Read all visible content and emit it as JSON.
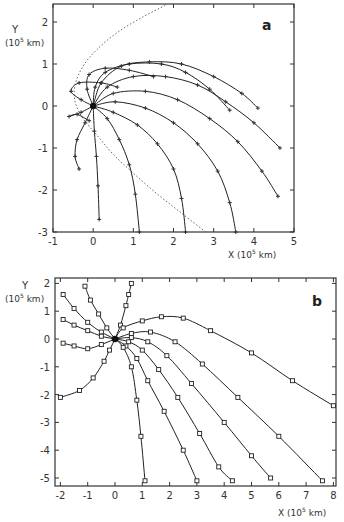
{
  "chart_data": [
    {
      "type": "line",
      "panel_label": "a",
      "xlabel": "X (10^5 km)",
      "ylabel": "Y (10^5 km)",
      "xlim": [
        -1,
        5
      ],
      "ylim": [
        -3,
        2.4
      ],
      "xticks": [
        -1,
        0,
        1,
        2,
        3,
        4,
        5
      ],
      "yticks": [
        -3,
        -2,
        -1,
        0,
        1,
        2
      ],
      "grid": false,
      "legend": null,
      "origin_marker": [
        0,
        0
      ],
      "boundary_dotted": [
        [
          2.8,
          -3
        ],
        [
          2.2,
          -2.55
        ],
        [
          1.6,
          -2.1
        ],
        [
          1.0,
          -1.6
        ],
        [
          0.5,
          -1.15
        ],
        [
          0.1,
          -0.7
        ],
        [
          -0.25,
          -0.3
        ],
        [
          -0.45,
          0.1
        ],
        [
          -0.45,
          0.5
        ],
        [
          -0.25,
          0.95
        ],
        [
          0.1,
          1.35
        ],
        [
          0.6,
          1.75
        ],
        [
          1.2,
          2.1
        ],
        [
          1.8,
          2.4
        ]
      ],
      "series": [
        {
          "name": "traj1",
          "points": [
            [
              0,
              0
            ],
            [
              -0.3,
              0.15
            ],
            [
              -0.55,
              0.35
            ],
            [
              -0.35,
              0.55
            ],
            [
              0.2,
              0.55
            ],
            [
              0.6,
              0.45
            ]
          ]
        },
        {
          "name": "traj2",
          "points": [
            [
              0,
              0
            ],
            [
              -0.15,
              0.4
            ],
            [
              -0.1,
              0.75
            ],
            [
              0.3,
              0.9
            ],
            [
              0.9,
              0.85
            ],
            [
              1.5,
              0.7
            ]
          ]
        },
        {
          "name": "traj3",
          "points": [
            [
              0,
              0
            ],
            [
              0.05,
              0.45
            ],
            [
              0.3,
              0.8
            ],
            [
              0.9,
              1.0
            ],
            [
              1.7,
              1.0
            ],
            [
              2.3,
              0.8
            ],
            [
              2.9,
              0.4
            ],
            [
              3.4,
              -0.1
            ]
          ]
        },
        {
          "name": "traj4",
          "points": [
            [
              0,
              0
            ],
            [
              0.2,
              0.55
            ],
            [
              0.7,
              0.95
            ],
            [
              1.4,
              1.05
            ],
            [
              2.2,
              1.0
            ],
            [
              3.0,
              0.7
            ],
            [
              3.7,
              0.3
            ],
            [
              4.1,
              -0.05
            ]
          ]
        },
        {
          "name": "traj5",
          "points": [
            [
              0,
              0
            ],
            [
              0.35,
              0.45
            ],
            [
              1.0,
              0.7
            ],
            [
              1.8,
              0.7
            ],
            [
              2.6,
              0.5
            ],
            [
              3.3,
              0.1
            ],
            [
              4.0,
              -0.4
            ],
            [
              4.65,
              -1.0
            ]
          ]
        },
        {
          "name": "traj6",
          "points": [
            [
              0,
              0
            ],
            [
              0.5,
              0.3
            ],
            [
              1.3,
              0.35
            ],
            [
              2.1,
              0.15
            ],
            [
              2.9,
              -0.3
            ],
            [
              3.6,
              -0.85
            ],
            [
              4.2,
              -1.55
            ],
            [
              4.6,
              -2.15
            ]
          ]
        },
        {
          "name": "traj7",
          "points": [
            [
              0,
              0
            ],
            [
              0.55,
              0.1
            ],
            [
              1.3,
              -0.05
            ],
            [
              2.0,
              -0.4
            ],
            [
              2.6,
              -0.9
            ],
            [
              3.1,
              -1.55
            ],
            [
              3.4,
              -2.3
            ],
            [
              3.55,
              -3
            ]
          ]
        },
        {
          "name": "traj8",
          "points": [
            [
              0,
              0
            ],
            [
              0.5,
              -0.15
            ],
            [
              1.1,
              -0.45
            ],
            [
              1.6,
              -0.9
            ],
            [
              2.0,
              -1.5
            ],
            [
              2.2,
              -2.2
            ],
            [
              2.3,
              -3
            ]
          ]
        },
        {
          "name": "traj9",
          "points": [
            [
              0,
              0
            ],
            [
              0.35,
              -0.3
            ],
            [
              0.65,
              -0.8
            ],
            [
              0.9,
              -1.4
            ],
            [
              1.05,
              -2.1
            ],
            [
              1.15,
              -3
            ]
          ]
        },
        {
          "name": "traj10",
          "points": [
            [
              0,
              0
            ],
            [
              0.03,
              -0.6
            ],
            [
              0.08,
              -1.2
            ],
            [
              0.12,
              -1.9
            ],
            [
              0.15,
              -2.7
            ]
          ]
        },
        {
          "name": "traj11",
          "points": [
            [
              0,
              0
            ],
            [
              -0.2,
              -0.4
            ],
            [
              -0.4,
              -0.8
            ],
            [
              -0.45,
              -1.2
            ],
            [
              -0.35,
              -1.5
            ]
          ]
        },
        {
          "name": "traj12",
          "points": [
            [
              0,
              0
            ],
            [
              -0.3,
              -0.15
            ],
            [
              -0.6,
              -0.25
            ],
            [
              -0.4,
              -0.2
            ],
            [
              -0.1,
              -0.35
            ]
          ]
        }
      ]
    },
    {
      "type": "line",
      "panel_label": "b",
      "xlabel": "X (10^5 km)",
      "ylabel": "Y (10^5 km)",
      "xlim": [
        -2,
        8
      ],
      "ylim": [
        -5,
        2
      ],
      "xticks": [
        -2,
        -1,
        0,
        1,
        2,
        3,
        4,
        5,
        6,
        7,
        8
      ],
      "yticks": [
        -5,
        -4,
        -3,
        -2,
        -1,
        0,
        1,
        2
      ],
      "grid": false,
      "legend": null,
      "origin_marker": [
        0,
        0
      ],
      "series": [
        {
          "name": "traj1",
          "points": [
            [
              0,
              0
            ],
            [
              0.2,
              0.5
            ],
            [
              0.4,
              1.2
            ],
            [
              0.5,
              1.6
            ],
            [
              0.6,
              2.0
            ]
          ]
        },
        {
          "name": "traj2",
          "points": [
            [
              0,
              0
            ],
            [
              -0.3,
              0.4
            ],
            [
              -0.6,
              0.9
            ],
            [
              -0.9,
              1.4
            ],
            [
              -1.1,
              1.9
            ]
          ]
        },
        {
          "name": "traj3",
          "points": [
            [
              0,
              0
            ],
            [
              -0.5,
              0.25
            ],
            [
              -1.0,
              0.6
            ],
            [
              -1.5,
              1.1
            ],
            [
              -1.9,
              1.6
            ]
          ]
        },
        {
          "name": "traj4",
          "points": [
            [
              0,
              0
            ],
            [
              -0.5,
              0.1
            ],
            [
              -1.0,
              0.3
            ],
            [
              -1.5,
              0.5
            ],
            [
              -1.9,
              0.7
            ]
          ]
        },
        {
          "name": "traj5",
          "points": [
            [
              0,
              0
            ],
            [
              -0.5,
              -0.2
            ],
            [
              -1.0,
              -0.35
            ],
            [
              -1.5,
              -0.25
            ],
            [
              -1.9,
              -0.15
            ]
          ]
        },
        {
          "name": "traj6",
          "points": [
            [
              0,
              0
            ],
            [
              -0.2,
              -0.4
            ],
            [
              -0.4,
              -0.8
            ],
            [
              -0.8,
              -1.4
            ],
            [
              -1.3,
              -1.85
            ],
            [
              -2.0,
              -2.1
            ]
          ]
        },
        {
          "name": "traj7",
          "points": [
            [
              0,
              0
            ],
            [
              0.3,
              0.4
            ],
            [
              1.0,
              0.65
            ],
            [
              1.7,
              0.8
            ],
            [
              2.5,
              0.75
            ],
            [
              3.5,
              0.3
            ],
            [
              5.0,
              -0.5
            ],
            [
              6.5,
              -1.5
            ],
            [
              8.0,
              -2.4
            ]
          ]
        },
        {
          "name": "traj8",
          "points": [
            [
              0,
              0
            ],
            [
              0.6,
              0.2
            ],
            [
              1.3,
              0.25
            ],
            [
              2.2,
              -0.1
            ],
            [
              3.2,
              -0.9
            ],
            [
              4.5,
              -2.1
            ],
            [
              6.0,
              -3.5
            ],
            [
              7.6,
              -5.1
            ]
          ]
        },
        {
          "name": "traj9",
          "points": [
            [
              0,
              0
            ],
            [
              0.6,
              0.05
            ],
            [
              1.2,
              -0.1
            ],
            [
              1.9,
              -0.6
            ],
            [
              2.8,
              -1.6
            ],
            [
              4.0,
              -3.0
            ],
            [
              5.0,
              -4.2
            ],
            [
              5.7,
              -5.0
            ]
          ]
        },
        {
          "name": "traj10",
          "points": [
            [
              0,
              0
            ],
            [
              0.5,
              -0.1
            ],
            [
              1.0,
              -0.4
            ],
            [
              1.6,
              -1.1
            ],
            [
              2.3,
              -2.1
            ],
            [
              3.1,
              -3.4
            ],
            [
              3.8,
              -4.6
            ],
            [
              4.3,
              -5.1
            ]
          ]
        },
        {
          "name": "traj11",
          "points": [
            [
              0,
              0
            ],
            [
              0.4,
              -0.25
            ],
            [
              0.8,
              -0.7
            ],
            [
              1.2,
              -1.5
            ],
            [
              1.8,
              -2.6
            ],
            [
              2.5,
              -4.0
            ],
            [
              3.0,
              -5.1
            ]
          ]
        },
        {
          "name": "traj12",
          "points": [
            [
              0,
              0
            ],
            [
              0.3,
              -0.3
            ],
            [
              0.6,
              -1.0
            ],
            [
              0.8,
              -2.2
            ],
            [
              0.95,
              -3.5
            ],
            [
              1.1,
              -5.1
            ]
          ]
        }
      ]
    }
  ],
  "panels": {
    "a": {
      "label": "a",
      "ylabel_line1": "Y",
      "ylabel_line2": "(10",
      "ylabel_exp": "5",
      "ylabel_unit": " km)",
      "xlabel_main": "X (10",
      "xlabel_exp": "5",
      "xlabel_unit": " km)",
      "xtick_labels": [
        "-1",
        "0",
        "1",
        "2",
        "3",
        "4",
        "5"
      ],
      "ytick_labels": [
        "2",
        "1",
        "0",
        "-1",
        "-2",
        "-3"
      ]
    },
    "b": {
      "label": "b",
      "ylabel_line1": "Y",
      "ylabel_line2": "(10",
      "ylabel_exp": "5",
      "ylabel_unit": " km)",
      "xlabel_main": "X (10",
      "xlabel_exp": "5",
      "xlabel_unit": " km)",
      "xtick_labels": [
        "-2",
        "-1",
        "0",
        "1",
        "2",
        "3",
        "4",
        "5",
        "6",
        "7",
        "8"
      ],
      "ytick_labels": [
        "2",
        "1",
        "0",
        "-1",
        "-2",
        "-3",
        "-4",
        "-5"
      ]
    }
  }
}
